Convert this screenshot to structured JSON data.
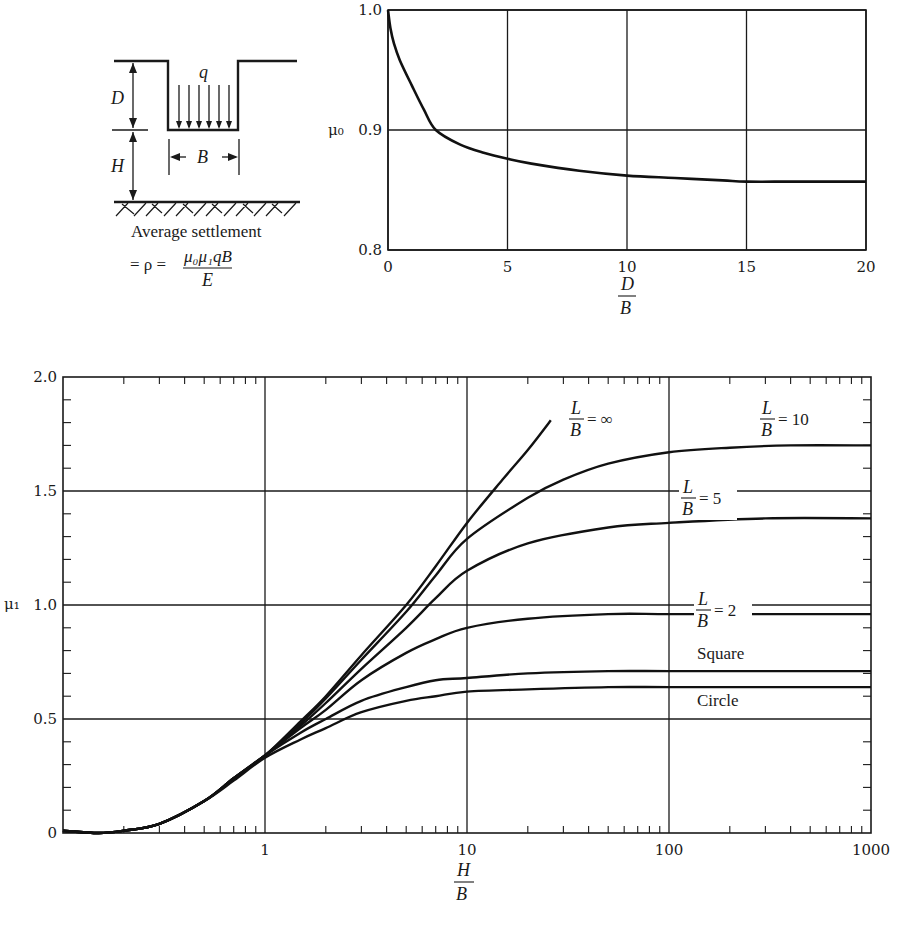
{
  "diagram": {
    "labels": {
      "q": "q",
      "D": "D",
      "H": "H",
      "B": "B"
    },
    "caption": "Average settlement",
    "formula": {
      "lhs": "= ρ =",
      "numerator": "μ₀μ₁qB",
      "denominator": "E"
    }
  },
  "chart_data": [
    {
      "id": "mu0",
      "type": "line",
      "title": "",
      "xlabel": {
        "num": "D",
        "den": "B"
      },
      "ylabel": "μ₀",
      "xlim": [
        0,
        20
      ],
      "ylim": [
        0.8,
        1.0
      ],
      "xticks": [
        0,
        5,
        10,
        15,
        20
      ],
      "yticks": [
        0.8,
        0.9,
        1.0
      ],
      "ytick_labels": [
        "0.8",
        "0.9",
        "1.0"
      ],
      "grid": true,
      "series": [
        {
          "name": "μ0",
          "x": [
            0,
            0.1,
            0.25,
            0.5,
            1,
            1.5,
            2,
            3,
            4,
            5,
            6,
            8,
            10,
            12,
            14,
            15,
            17,
            20
          ],
          "y": [
            1.0,
            0.985,
            0.972,
            0.958,
            0.937,
            0.917,
            0.9,
            0.888,
            0.881,
            0.876,
            0.872,
            0.866,
            0.862,
            0.86,
            0.858,
            0.857,
            0.857,
            0.857
          ]
        }
      ]
    },
    {
      "id": "mu1",
      "type": "line",
      "title": "",
      "xlabel": {
        "num": "H",
        "den": "B"
      },
      "ylabel": "μ₁",
      "xscale": "log",
      "xlim": [
        0.1,
        1000
      ],
      "ylim": [
        0,
        2.0
      ],
      "xticks": [
        1,
        10,
        100,
        1000
      ],
      "xtick_labels": [
        "1",
        "10",
        "100",
        "1000"
      ],
      "yticks": [
        0,
        0.5,
        1.0,
        1.5,
        2.0
      ],
      "ytick_labels": [
        "0",
        "0.5",
        "1.0",
        "1.5",
        "2.0"
      ],
      "grid": true,
      "series": [
        {
          "name": "L/B = ∞",
          "label": {
            "num": "L",
            "den": "B",
            "eq": "= ∞"
          },
          "x": [
            0.1,
            0.15,
            0.2,
            0.3,
            0.5,
            0.7,
            1,
            1.5,
            2,
            3,
            5,
            7,
            10,
            15,
            20,
            26
          ],
          "y": [
            0.01,
            0.0,
            0.01,
            0.04,
            0.14,
            0.24,
            0.34,
            0.49,
            0.6,
            0.78,
            1.0,
            1.17,
            1.36,
            1.55,
            1.68,
            1.81
          ]
        },
        {
          "name": "L/B = 10",
          "label": {
            "num": "L",
            "den": "B",
            "eq": "= 10"
          },
          "x": [
            0.1,
            0.15,
            0.2,
            0.3,
            0.5,
            0.7,
            1,
            1.5,
            2,
            3,
            5,
            7,
            10,
            20,
            30,
            50,
            100,
            200,
            400,
            1000
          ],
          "y": [
            0.01,
            0.0,
            0.01,
            0.04,
            0.14,
            0.24,
            0.34,
            0.48,
            0.59,
            0.76,
            0.97,
            1.13,
            1.29,
            1.47,
            1.55,
            1.62,
            1.67,
            1.69,
            1.7,
            1.7
          ]
        },
        {
          "name": "L/B = 5",
          "label": {
            "num": "L",
            "den": "B",
            "eq": "= 5"
          },
          "x": [
            0.1,
            0.15,
            0.2,
            0.3,
            0.5,
            0.7,
            1,
            1.5,
            2,
            3,
            5,
            7,
            10,
            20,
            50,
            100,
            300,
            1000
          ],
          "y": [
            0.01,
            0.0,
            0.01,
            0.04,
            0.14,
            0.24,
            0.34,
            0.47,
            0.57,
            0.72,
            0.9,
            1.03,
            1.15,
            1.27,
            1.34,
            1.36,
            1.38,
            1.38
          ]
        },
        {
          "name": "L/B = 2",
          "label": {
            "num": "L",
            "den": "B",
            "eq": "= 2"
          },
          "x": [
            0.1,
            0.15,
            0.2,
            0.3,
            0.5,
            0.7,
            1,
            1.5,
            2,
            3,
            5,
            7,
            10,
            20,
            50,
            100,
            300,
            1000
          ],
          "y": [
            0.01,
            0.0,
            0.01,
            0.04,
            0.14,
            0.24,
            0.34,
            0.46,
            0.54,
            0.67,
            0.79,
            0.85,
            0.9,
            0.94,
            0.96,
            0.96,
            0.96,
            0.96
          ]
        },
        {
          "name": "Square",
          "label": {
            "text": "Square"
          },
          "x": [
            0.1,
            0.15,
            0.2,
            0.3,
            0.5,
            0.7,
            1,
            1.5,
            2,
            3,
            5,
            7,
            10,
            20,
            50,
            100,
            300,
            1000
          ],
          "y": [
            0.01,
            0.0,
            0.01,
            0.04,
            0.14,
            0.24,
            0.34,
            0.44,
            0.5,
            0.58,
            0.64,
            0.67,
            0.68,
            0.7,
            0.71,
            0.71,
            0.71,
            0.71
          ]
        },
        {
          "name": "Circle",
          "label": {
            "text": "Circle"
          },
          "x": [
            0.1,
            0.15,
            0.2,
            0.3,
            0.5,
            0.7,
            1,
            1.5,
            2,
            3,
            5,
            7,
            10,
            20,
            50,
            100,
            300,
            1000
          ],
          "y": [
            0.01,
            0.0,
            0.01,
            0.04,
            0.14,
            0.23,
            0.33,
            0.41,
            0.46,
            0.53,
            0.58,
            0.6,
            0.62,
            0.63,
            0.64,
            0.64,
            0.64,
            0.64
          ]
        }
      ]
    }
  ]
}
